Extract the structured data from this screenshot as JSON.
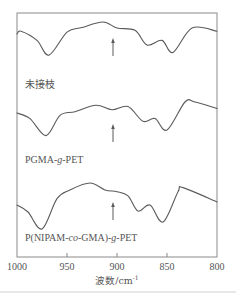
{
  "chart_data": {
    "type": "line",
    "title": "",
    "xlabel": "波数/cm⁻¹",
    "ylabel": "",
    "xlim": [
      1000,
      800
    ],
    "x_reversed": true,
    "xticks": [
      1000,
      950,
      900,
      850,
      800
    ],
    "grid": false,
    "legend": "inline labels below each curve",
    "series": [
      {
        "name": "未接枝",
        "offset_rank": 1,
        "x": [
          1000,
          996,
          980,
          968,
          950,
          935,
          914,
          900,
          882,
          870,
          855,
          844,
          825,
          800
        ],
        "y_relative": [
          0.74,
          0.8,
          0.6,
          0.28,
          0.78,
          0.88,
          1.0,
          0.87,
          0.82,
          0.5,
          0.6,
          0.34,
          0.87,
          0.8
        ],
        "arrow_at": 904
      },
      {
        "name": "PGMA-g-PET",
        "offset_rank": 2,
        "x": [
          1000,
          987,
          971,
          957,
          942,
          921,
          905,
          889,
          874,
          862,
          850,
          832,
          822,
          800
        ],
        "y_relative": [
          0.76,
          0.64,
          0.27,
          0.71,
          0.79,
          0.93,
          0.83,
          0.9,
          0.58,
          0.64,
          0.39,
          1.0,
          1.0,
          0.86
        ],
        "arrow_at": 904
      },
      {
        "name": "P(NIPAM-co-GMA)-g-PET",
        "offset_rank": 3,
        "x": [
          1000,
          989,
          975,
          960,
          947,
          927,
          912,
          900,
          889,
          879,
          867,
          854,
          839,
          834,
          800
        ],
        "y_relative": [
          0.52,
          0.37,
          0.0,
          0.66,
          0.85,
          1.0,
          0.85,
          0.81,
          0.72,
          0.39,
          0.52,
          0.15,
          0.81,
          0.9,
          0.59
        ],
        "arrow_at": 904
      }
    ],
    "annotations": [
      {
        "type": "arrow",
        "direction": "up",
        "x": 904,
        "series": "未接枝"
      },
      {
        "type": "arrow",
        "direction": "up",
        "x": 904,
        "series": "PGMA-g-PET"
      },
      {
        "type": "arrow",
        "direction": "up",
        "x": 904,
        "series": "P(NIPAM-co-GMA)-g-PET"
      }
    ]
  },
  "labels": {
    "series1": "未接枝",
    "series2_parts": [
      "PGMA-",
      "g",
      "-PET"
    ],
    "series3_parts": [
      "P(NIPAM-",
      "co",
      "-GMA)-",
      "g",
      "-PET"
    ],
    "xaxis_main": "波数/cm",
    "xaxis_sup": "-1",
    "ticks": [
      "1000",
      "950",
      "900",
      "850",
      "800"
    ]
  },
  "colors": {
    "curve": "#5a5a5a",
    "frame": "#8a8a8a",
    "text": "#555555"
  }
}
